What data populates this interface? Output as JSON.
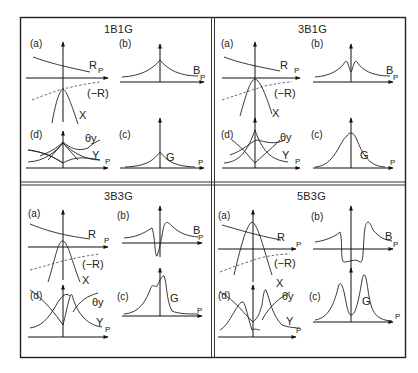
{
  "figure": {
    "panels": [
      {
        "title": "1B1G",
        "sub": {
          "a": "(a)",
          "b": "(b)",
          "c": "(c)",
          "d": "(d)"
        },
        "labels": {
          "R": "R",
          "minusR": "(−R)",
          "X": "X",
          "B": "B",
          "G": "G",
          "Y": "Y",
          "thetaY": "θy",
          "P": "P"
        }
      },
      {
        "title": "3B1G",
        "sub": {
          "a": "(a)",
          "b": "(b)",
          "c": "(c)",
          "d": "(d)"
        },
        "labels": {
          "R": "R",
          "minusR": "(−R)",
          "X": "X",
          "B": "B",
          "G": "G",
          "Y": "Y",
          "thetaY": "θy",
          "P": "P"
        }
      },
      {
        "title": "3B3G",
        "sub": {
          "a": "(a)",
          "b": "(b)",
          "c": "(c)",
          "d": "(d)"
        },
        "labels": {
          "R": "R",
          "minusR": "(−R)",
          "X": "X",
          "B": "B",
          "G": "G",
          "Y": "Y",
          "thetaY": "θy",
          "P": "P"
        }
      },
      {
        "title": "5B3G",
        "sub": {
          "a": "(a)",
          "b": "(b)",
          "c": "(c)",
          "d": "(d)"
        },
        "labels": {
          "R": "R",
          "minusR": "(−R)",
          "X": "X",
          "B": "B",
          "G": "G",
          "Y": "Y",
          "thetaY": "θy",
          "P": "P"
        }
      }
    ]
  }
}
